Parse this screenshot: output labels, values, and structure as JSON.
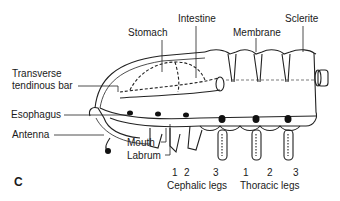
{
  "figure": {
    "panel_label": "C",
    "labels": {
      "stomach": "Stomach",
      "intestine": "Intestine",
      "membrane": "Membrane",
      "sclerite": "Sclerite",
      "transverse_1": "Transverse",
      "transverse_2": "tendinous bar",
      "esophagus": "Esophagus",
      "antenna": "Antenna",
      "mouth": "Mouth",
      "labrum": "Labrum"
    },
    "cephalic_legs": {
      "numbers": [
        "1",
        "2",
        "3"
      ],
      "title": "Cephalic legs"
    },
    "thoracic_legs": {
      "numbers": [
        "1",
        "2",
        "3"
      ],
      "title": "Thoracic legs"
    }
  }
}
